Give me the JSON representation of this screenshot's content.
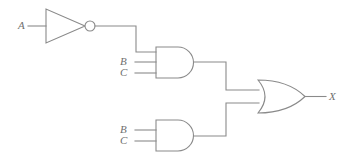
{
  "diagram": {
    "type": "logic-circuit",
    "line_color": "#8a8a8a",
    "label_color": "#6f6f6f",
    "background_color": "#ffffff",
    "output_expression": "X = (NOT A AND B AND C) OR (B AND C)"
  },
  "labels": {
    "input_a": "A",
    "and1_input_b": "B",
    "and1_input_c": "C",
    "and2_input_b": "B",
    "and2_input_c": "C",
    "output_x": "X"
  },
  "gates": [
    {
      "id": "inverter",
      "name": "NOT gate",
      "symbol": "triangle-with-bubble",
      "inputs": [
        "A"
      ],
      "output": "NOT A"
    },
    {
      "id": "and-top",
      "name": "AND gate (3-input)",
      "symbol": "d-shape",
      "inputs": [
        "NOT A",
        "B",
        "C"
      ],
      "output": "NOT A AND B AND C"
    },
    {
      "id": "and-bottom",
      "name": "AND gate (2-input)",
      "symbol": "d-shape",
      "inputs": [
        "B",
        "C"
      ],
      "output": "B AND C"
    },
    {
      "id": "or-out",
      "name": "OR gate (2-input)",
      "symbol": "curved-shield",
      "inputs": [
        "NOT A AND B AND C",
        "B AND C"
      ],
      "output": "X"
    }
  ]
}
